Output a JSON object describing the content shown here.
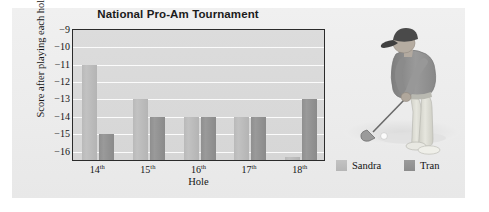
{
  "chart_data": {
    "type": "bar",
    "title": "National Pro-Am Tournament",
    "xlabel": "Hole",
    "ylabel": "Score after playing each hole",
    "categories": [
      "14th",
      "15th",
      "16th",
      "17th",
      "18th"
    ],
    "series": [
      {
        "name": "Sandra",
        "color": "#bcbcbc",
        "values": [
          -11,
          -13,
          -14,
          -14,
          -16.3
        ]
      },
      {
        "name": "Tran",
        "color": "#929292",
        "values": [
          -15,
          -14,
          -14,
          -14,
          -13
        ]
      }
    ],
    "ylim": [
      -16.6,
      -9
    ],
    "yticks": [
      -9,
      -10,
      -11,
      -12,
      -13,
      -14,
      -15,
      -16
    ],
    "ytick_labels": [
      "−9",
      "−10",
      "−11",
      "−12",
      "−13",
      "−14",
      "−15",
      "−16"
    ],
    "grid": "horizontal",
    "legend_position": "bottom-right",
    "plot_background": "#d8d8d8",
    "panel_background": "#eeeeee",
    "axis_color": "#2b2b2b",
    "gridline_color": "#fbfbfb"
  },
  "legend": {
    "items": [
      {
        "label": "Sandra"
      },
      {
        "label": "Tran"
      }
    ]
  },
  "illustration": {
    "name": "golfer-photo",
    "alt": "Golfer addressing the ball with a club",
    "cap_color": "#4a4a4a",
    "shirt_color": "#8d8d8d",
    "pants_color": "#dcdcd4",
    "ground_color": "#e3e3e3"
  }
}
